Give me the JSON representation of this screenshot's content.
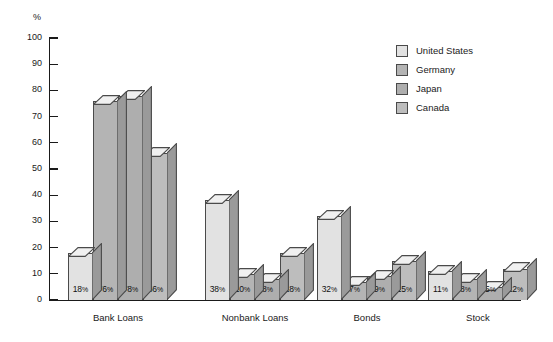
{
  "chart_data": {
    "type": "bar",
    "title": "",
    "xlabel": "",
    "ylabel": "%",
    "ylim": [
      0,
      100
    ],
    "y_ticks": [
      0,
      10,
      20,
      30,
      40,
      50,
      60,
      70,
      80,
      90,
      100
    ],
    "grid": false,
    "legend_position": "top-right",
    "categories": [
      "Bank Loans",
      "Nonbank Loans",
      "Bonds",
      "Stock"
    ],
    "series": [
      {
        "name": "United States",
        "values": [
          18,
          38,
          32,
          11
        ],
        "color": "#e2e2e2"
      },
      {
        "name": "Germany",
        "values": [
          76,
          10,
          7,
          8
        ],
        "color": "#b4b4b4"
      },
      {
        "name": "Japan",
        "values": [
          78,
          8,
          9,
          5
        ],
        "color": "#aeaeae"
      },
      {
        "name": "Canada",
        "values": [
          56,
          18,
          15,
          12
        ],
        "color": "#bdbdbd"
      }
    ],
    "value_labels": [
      [
        "18%",
        "76%",
        "78%",
        "56%"
      ],
      [
        "38%",
        "10%",
        "8%",
        "18%"
      ],
      [
        "32%",
        "7%",
        "9%",
        "15%"
      ],
      [
        "11%",
        "8%",
        "5%",
        "12%"
      ]
    ],
    "axis_unit_label": "%",
    "colors": {
      "outline": "#4a4a4a",
      "axis": "#1a1a1a",
      "top_face": "#f0f0f0",
      "side_face": "#9a9a9a",
      "background": "#ffffff"
    }
  }
}
